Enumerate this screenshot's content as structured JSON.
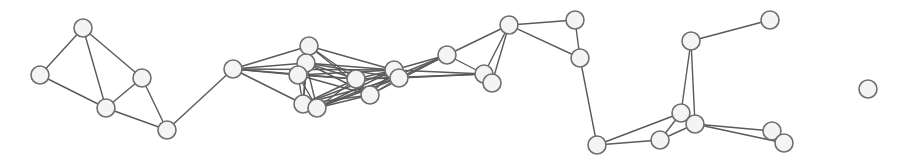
{
  "graph": {
    "width": 905,
    "height": 168,
    "style": {
      "background": "#ffffff",
      "node_fill": "#f4f4f4",
      "node_stroke": "#6e6e6e",
      "edge_stroke": "#5a5a5a",
      "node_radius": 9
    },
    "nodes": [
      {
        "id": "A",
        "x": 83,
        "y": 28
      },
      {
        "id": "B",
        "x": 40,
        "y": 75
      },
      {
        "id": "C",
        "x": 142,
        "y": 78
      },
      {
        "id": "D",
        "x": 106,
        "y": 108
      },
      {
        "id": "E",
        "x": 167,
        "y": 130
      },
      {
        "id": "F",
        "x": 233,
        "y": 69
      },
      {
        "id": "G",
        "x": 309,
        "y": 46
      },
      {
        "id": "H",
        "x": 306,
        "y": 63
      },
      {
        "id": "I",
        "x": 298,
        "y": 75
      },
      {
        "id": "J",
        "x": 303,
        "y": 104
      },
      {
        "id": "K",
        "x": 317,
        "y": 108
      },
      {
        "id": "L",
        "x": 356,
        "y": 79
      },
      {
        "id": "M",
        "x": 370,
        "y": 95
      },
      {
        "id": "N",
        "x": 394,
        "y": 70
      },
      {
        "id": "O",
        "x": 399,
        "y": 78
      },
      {
        "id": "P",
        "x": 447,
        "y": 55
      },
      {
        "id": "Q",
        "x": 484,
        "y": 74
      },
      {
        "id": "R",
        "x": 492,
        "y": 83
      },
      {
        "id": "S",
        "x": 509,
        "y": 25
      },
      {
        "id": "T",
        "x": 575,
        "y": 20
      },
      {
        "id": "U",
        "x": 580,
        "y": 58
      },
      {
        "id": "V",
        "x": 597,
        "y": 145
      },
      {
        "id": "W",
        "x": 660,
        "y": 140
      },
      {
        "id": "X",
        "x": 681,
        "y": 113
      },
      {
        "id": "Y",
        "x": 695,
        "y": 124
      },
      {
        "id": "Z",
        "x": 691,
        "y": 41
      },
      {
        "id": "AA",
        "x": 770,
        "y": 20
      },
      {
        "id": "AB",
        "x": 772,
        "y": 131
      },
      {
        "id": "AC",
        "x": 784,
        "y": 143
      },
      {
        "id": "AD",
        "x": 868,
        "y": 89
      }
    ],
    "edges": [
      [
        "A",
        "B"
      ],
      [
        "A",
        "D"
      ],
      [
        "A",
        "C"
      ],
      [
        "B",
        "D"
      ],
      [
        "C",
        "D"
      ],
      [
        "C",
        "E"
      ],
      [
        "D",
        "E"
      ],
      [
        "E",
        "F"
      ],
      [
        "F",
        "G"
      ],
      [
        "F",
        "H"
      ],
      [
        "F",
        "I"
      ],
      [
        "F",
        "J"
      ],
      [
        "F",
        "L"
      ],
      [
        "F",
        "N"
      ],
      [
        "G",
        "H"
      ],
      [
        "G",
        "I"
      ],
      [
        "G",
        "J"
      ],
      [
        "G",
        "L"
      ],
      [
        "G",
        "N"
      ],
      [
        "G",
        "M"
      ],
      [
        "H",
        "I"
      ],
      [
        "H",
        "J"
      ],
      [
        "H",
        "K"
      ],
      [
        "H",
        "L"
      ],
      [
        "H",
        "M"
      ],
      [
        "H",
        "N"
      ],
      [
        "H",
        "O"
      ],
      [
        "I",
        "J"
      ],
      [
        "I",
        "K"
      ],
      [
        "I",
        "L"
      ],
      [
        "I",
        "M"
      ],
      [
        "I",
        "N"
      ],
      [
        "J",
        "K"
      ],
      [
        "J",
        "L"
      ],
      [
        "J",
        "M"
      ],
      [
        "J",
        "N"
      ],
      [
        "J",
        "O"
      ],
      [
        "K",
        "L"
      ],
      [
        "K",
        "M"
      ],
      [
        "K",
        "N"
      ],
      [
        "K",
        "O"
      ],
      [
        "K",
        "P"
      ],
      [
        "L",
        "M"
      ],
      [
        "L",
        "N"
      ],
      [
        "L",
        "O"
      ],
      [
        "L",
        "Q"
      ],
      [
        "M",
        "N"
      ],
      [
        "M",
        "O"
      ],
      [
        "M",
        "P"
      ],
      [
        "N",
        "O"
      ],
      [
        "N",
        "P"
      ],
      [
        "N",
        "Q"
      ],
      [
        "O",
        "P"
      ],
      [
        "O",
        "Q"
      ],
      [
        "P",
        "Q"
      ],
      [
        "P",
        "S"
      ],
      [
        "Q",
        "S"
      ],
      [
        "R",
        "S"
      ],
      [
        "Q",
        "R"
      ],
      [
        "S",
        "T"
      ],
      [
        "S",
        "U"
      ],
      [
        "T",
        "U"
      ],
      [
        "U",
        "V"
      ],
      [
        "V",
        "W"
      ],
      [
        "V",
        "X"
      ],
      [
        "W",
        "X"
      ],
      [
        "W",
        "Y"
      ],
      [
        "X",
        "Z"
      ],
      [
        "Y",
        "Z"
      ],
      [
        "Z",
        "AA"
      ],
      [
        "Y",
        "AB"
      ],
      [
        "Y",
        "AC"
      ],
      [
        "AB",
        "AC"
      ]
    ]
  }
}
